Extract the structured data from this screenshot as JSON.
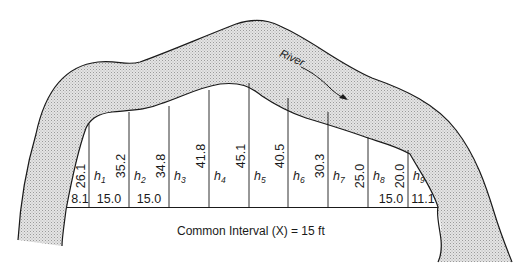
{
  "figure": {
    "river_label": "River",
    "caption": "Common Interval (X) = 15 ft",
    "colors": {
      "ink": "#1a1a1a",
      "river_fill": "#d9d9d9",
      "background": "#ffffff"
    },
    "offsets": [
      "26.1",
      "35.2",
      "34.8",
      "41.8",
      "45.1",
      "40.5",
      "30.3",
      "25.0",
      "20.0"
    ],
    "strips": [
      {
        "label": "h",
        "sub": "1"
      },
      {
        "label": "h",
        "sub": "2"
      },
      {
        "label": "h",
        "sub": "3"
      },
      {
        "label": "h",
        "sub": "4"
      },
      {
        "label": "h",
        "sub": "5"
      },
      {
        "label": "h",
        "sub": "6"
      },
      {
        "label": "h",
        "sub": "7"
      },
      {
        "label": "h",
        "sub": "8"
      },
      {
        "label": "h",
        "sub": "9"
      }
    ],
    "intervals": [
      {
        "strip": "end-left",
        "value": "8.1"
      },
      {
        "strip": "1",
        "value": "15.0"
      },
      {
        "strip": "2",
        "value": "15.0"
      },
      {
        "strip": "8",
        "value": "15.0"
      },
      {
        "strip": "end-right",
        "value": "11.1"
      }
    ]
  }
}
